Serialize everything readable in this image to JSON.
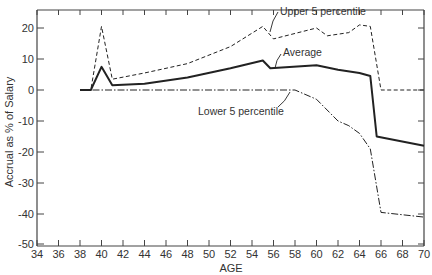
{
  "chart_data": {
    "type": "line",
    "title": "",
    "xlabel": "AGE",
    "ylabel": "Accrual as % of Salary",
    "xlim": [
      34,
      70
    ],
    "ylim": [
      -50,
      26
    ],
    "x_ticks": [
      34,
      36,
      38,
      40,
      42,
      44,
      46,
      48,
      50,
      52,
      54,
      56,
      58,
      60,
      62,
      64,
      66,
      68,
      70
    ],
    "y_ticks": [
      20,
      10,
      0,
      -10,
      -20,
      -30,
      -40,
      -50
    ],
    "grid": false,
    "legend": "none (inline annotations)",
    "series": [
      {
        "name": "Upper 5 percentile",
        "style": "dashed",
        "x": [
          38,
          39,
          40,
          41,
          44,
          48,
          52,
          55,
          55.5,
          56,
          60,
          61,
          63,
          64,
          65,
          66,
          70
        ],
        "values": [
          0,
          0,
          20.5,
          3.5,
          5.5,
          8.5,
          14,
          20.5,
          18.5,
          16.5,
          20,
          17.5,
          18.5,
          21,
          20.5,
          0,
          0
        ]
      },
      {
        "name": "Average",
        "style": "solid",
        "x": [
          38,
          39,
          40,
          41,
          44,
          48,
          52,
          55,
          55.7,
          60,
          62,
          64,
          65,
          65.6,
          70
        ],
        "values": [
          0,
          0,
          7.5,
          1.5,
          2,
          4,
          7,
          9.5,
          7,
          8,
          6.5,
          5.5,
          4.5,
          -15,
          -18
        ]
      },
      {
        "name": "Lower 5 percentile",
        "style": "dash-dot",
        "x": [
          38,
          58,
          60,
          62,
          63,
          64,
          65,
          66,
          70
        ],
        "values": [
          0,
          0,
          -3,
          -10,
          -11.5,
          -14,
          -19,
          -39.5,
          -41
        ]
      }
    ],
    "annotations": [
      {
        "text": "Upper 5 percentile",
        "points_to": [
          55.5,
          18.5
        ]
      },
      {
        "text": "Average",
        "points_to": [
          56,
          7.5
        ]
      },
      {
        "text": "Lower 5 percentile",
        "points_to": [
          58.5,
          0
        ]
      }
    ]
  },
  "labels": {
    "xlabel": "AGE",
    "ylabel": "Accrual as % of Salary",
    "upper": "Upper 5 percentile",
    "average": "Average",
    "lower": "Lower 5 percentile"
  },
  "colors": {
    "line": "#222222",
    "axis": "#444444",
    "text": "#333333"
  }
}
